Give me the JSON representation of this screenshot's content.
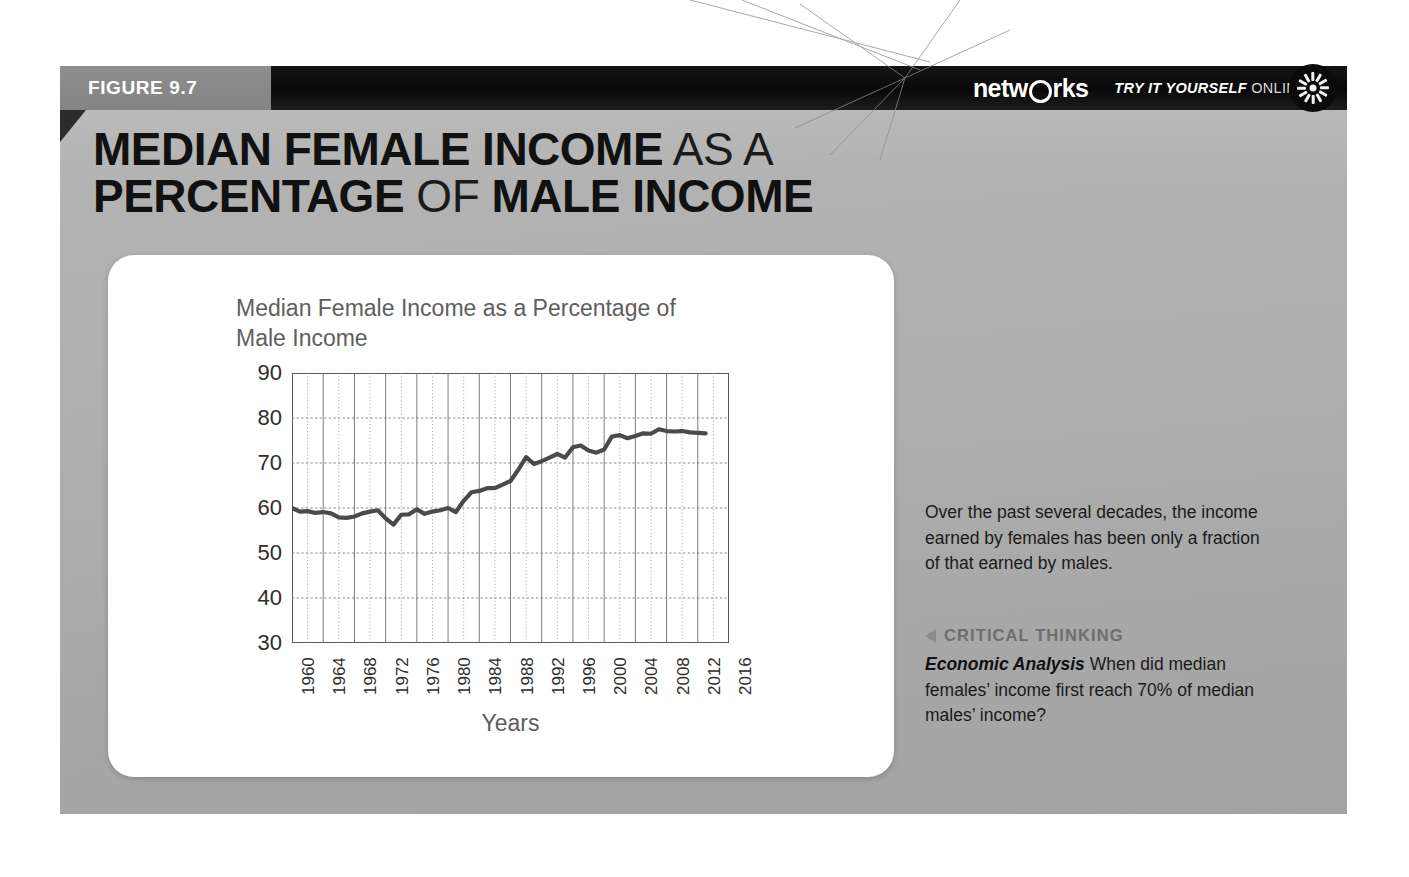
{
  "figure": {
    "tab_label": "FIGURE 9.7",
    "headline_parts": [
      {
        "text": "MEDIAN FEMALE INCOME",
        "weight": "bold"
      },
      {
        "text": " AS A",
        "weight": "light"
      },
      {
        "text": "PERCENTAGE",
        "weight": "bold"
      },
      {
        "text": " OF ",
        "weight": "light"
      },
      {
        "text": "MALE INCOME",
        "weight": "bold"
      }
    ],
    "headline_line1_bold": "MEDIAN FEMALE INCOME",
    "headline_line1_light": "AS A",
    "headline_line2_bold_a": "PERCENTAGE",
    "headline_line2_light": "OF",
    "headline_line2_bold_b": "MALE INCOME"
  },
  "banner": {
    "brand_pre": "netw",
    "brand_post": "rks",
    "try_it_em": "TRY IT YOURSELF",
    "try_it_rest": "ONLINE",
    "sunburst_icon": "sunburst-icon"
  },
  "sidebar_text": {
    "caption": "Over the past several decades, the income earned by females has been only a fraction of that earned by males.",
    "critical_thinking_label": "CRITICAL THINKING",
    "critical_thinking_arrow_icon": "left-triangle-icon",
    "question_lead": "Economic Analysis",
    "question_body": "When did median females’ income first reach 70% of median males’ income?"
  },
  "footer": {
    "url": "connected.mcgraw-hill.com"
  },
  "colors": {
    "panel_gray": "#b0b0b0",
    "tab_gray": "#8a8a8a",
    "banner_black": "#0d0d0d",
    "line_color": "#4a4a4a",
    "card_white": "#ffffff",
    "axis_text": "#2d2d2d",
    "title_text": "#5e5e5e"
  },
  "chart_data": {
    "type": "line",
    "title": "Median Female Income as a Percentage of Male Income",
    "xlabel": "Years",
    "ylabel": "",
    "xlim": [
      1960,
      2016
    ],
    "ylim": [
      30,
      90
    ],
    "ytick_labels": [
      "30",
      "40",
      "50",
      "60",
      "70",
      "80",
      "90"
    ],
    "yticks": [
      30,
      40,
      50,
      60,
      70,
      80,
      90
    ],
    "xtick_labels": [
      "1960",
      "1964",
      "1968",
      "1972",
      "1976",
      "1980",
      "1984",
      "1988",
      "1992",
      "1996",
      "2000",
      "2004",
      "2008",
      "2012",
      "2016"
    ],
    "xticks": [
      1960,
      1964,
      1968,
      1972,
      1976,
      1980,
      1984,
      1988,
      1992,
      1996,
      2000,
      2004,
      2008,
      2012,
      2016
    ],
    "grid": true,
    "minor_grid_interval_years": 2,
    "legend": null,
    "series": [
      {
        "name": "Median female income as a percentage of male income",
        "x": [
          1960,
          1961,
          1962,
          1963,
          1964,
          1965,
          1966,
          1967,
          1968,
          1969,
          1970,
          1971,
          1972,
          1973,
          1974,
          1975,
          1976,
          1977,
          1978,
          1979,
          1980,
          1981,
          1982,
          1983,
          1984,
          1985,
          1986,
          1987,
          1988,
          1989,
          1990,
          1991,
          1992,
          1993,
          1994,
          1995,
          1996,
          1997,
          1998,
          1999,
          2000,
          2001,
          2002,
          2003,
          2004,
          2005,
          2006,
          2007,
          2008,
          2009,
          2010,
          2011,
          2012,
          2013
        ],
        "values": [
          60.0,
          59.2,
          59.3,
          58.9,
          59.1,
          58.8,
          57.9,
          57.8,
          58.1,
          58.8,
          59.2,
          59.5,
          57.7,
          56.3,
          58.5,
          58.6,
          59.7,
          58.7,
          59.2,
          59.5,
          60.0,
          59.1,
          61.6,
          63.5,
          63.8,
          64.4,
          64.4,
          65.2,
          66.0,
          68.5,
          71.3,
          69.8,
          70.4,
          71.2,
          72.0,
          71.2,
          73.5,
          73.9,
          72.8,
          72.3,
          73.0,
          75.9,
          76.2,
          75.5,
          76.0,
          76.6,
          76.5,
          77.5,
          77.1,
          77.0,
          77.1,
          76.8,
          76.7,
          76.6
        ]
      }
    ]
  }
}
